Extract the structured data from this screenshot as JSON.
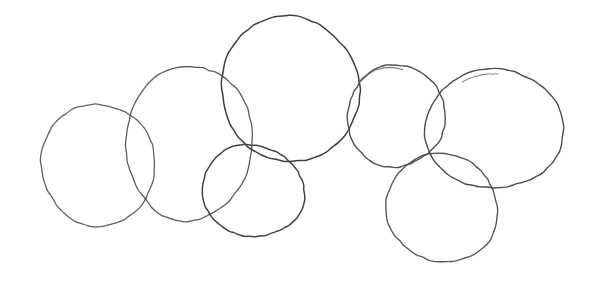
{
  "scene": {
    "title": "Hand-drawn overlapping circles sketch",
    "background_color": "#ffffff",
    "width": 599,
    "height": 285,
    "medium": "pencil sketch",
    "stroke_color": "#555555",
    "stroke_color_dark": "#3c3c3c",
    "stroke_color_faint": "#9a9a9a",
    "shape_count": 7
  },
  "shapes": [
    {
      "id": "circle-1",
      "name": "left-circle",
      "center_x": 98,
      "center_y": 165,
      "radius_x": 58,
      "radius_y": 60,
      "rotation": -8,
      "stroke_color": "#5a5a5a",
      "stroke_width": 1.3,
      "opacity": 0.95,
      "wobble": 2.2,
      "seed": 11
    },
    {
      "id": "circle-2",
      "name": "left-center-tall-circle",
      "center_x": 189,
      "center_y": 143,
      "radius_x": 62,
      "radius_y": 79,
      "rotation": 6,
      "stroke_color": "#4e4e4e",
      "stroke_width": 1.3,
      "opacity": 0.92,
      "wobble": 2.6,
      "seed": 23
    },
    {
      "id": "circle-3",
      "name": "top-large-circle",
      "center_x": 290,
      "center_y": 89,
      "radius_x": 70,
      "radius_y": 72,
      "rotation": -12,
      "stroke_color": "#3f3f3f",
      "stroke_width": 1.5,
      "opacity": 1,
      "wobble": 2.4,
      "seed": 37
    },
    {
      "id": "circle-4",
      "name": "bottom-center-small-circle",
      "center_x": 253,
      "center_y": 191,
      "radius_x": 51,
      "radius_y": 46,
      "rotation": 4,
      "stroke_color": "#444444",
      "stroke_width": 1.5,
      "opacity": 1,
      "wobble": 2.0,
      "seed": 53
    },
    {
      "id": "circle-5",
      "name": "right-center-circle",
      "center_x": 396,
      "center_y": 116,
      "radius_x": 50,
      "radius_y": 50,
      "rotation": -5,
      "stroke_color": "#4a4a4a",
      "stroke_width": 1.4,
      "opacity": 0.96,
      "wobble": 2.3,
      "seed": 67
    },
    {
      "id": "circle-6",
      "name": "right-large-circle",
      "center_x": 494,
      "center_y": 129,
      "radius_x": 70,
      "radius_y": 59,
      "rotation": -7,
      "stroke_color": "#474747",
      "stroke_width": 1.4,
      "opacity": 0.97,
      "wobble": 2.4,
      "seed": 83
    },
    {
      "id": "circle-7",
      "name": "bottom-right-circle",
      "center_x": 442,
      "center_y": 208,
      "radius_x": 56,
      "radius_y": 54,
      "rotation": 9,
      "stroke_color": "#505050",
      "stroke_width": 1.4,
      "opacity": 0.95,
      "wobble": 2.1,
      "seed": 97
    }
  ],
  "accents": [
    {
      "id": "accent-1",
      "name": "double-stroke-top-of-right-center-circle",
      "center_x": 392,
      "center_y": 113,
      "radius_x": 42,
      "radius_y": 46,
      "rotation": -14,
      "arc_start_deg": 238,
      "arc_end_deg": 300,
      "stroke_color": "#6a6a6a",
      "stroke_width": 1.2,
      "opacity": 0.85,
      "wobble": 1.4,
      "seed": 131
    },
    {
      "id": "accent-2",
      "name": "double-stroke-top-of-right-large-circle",
      "center_x": 492,
      "center_y": 131,
      "radius_x": 62,
      "radius_y": 56,
      "rotation": -9,
      "arc_start_deg": 250,
      "arc_end_deg": 284,
      "stroke_color": "#6f6f6f",
      "stroke_width": 1.1,
      "opacity": 0.8,
      "wobble": 1.2,
      "seed": 149
    }
  ]
}
